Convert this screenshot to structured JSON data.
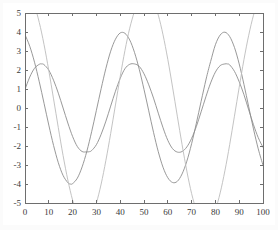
{
  "chart_data": {
    "type": "line",
    "title": "",
    "subtitle": "",
    "xlabel": "",
    "ylabel": "",
    "xlim": [
      0,
      100
    ],
    "ylim": [
      -5,
      5
    ],
    "grid": false,
    "legend": "none",
    "background_color": "#ffffff",
    "frame_color": "#6e6e6e",
    "xticks": [
      0,
      10,
      20,
      30,
      40,
      50,
      60,
      70,
      80,
      90,
      100
    ],
    "xtick_labels": [
      "0",
      "10",
      "20",
      "30",
      "40",
      "50",
      "60",
      "70",
      "80",
      "90",
      "100"
    ],
    "yticks": [
      -5,
      -4,
      -3,
      -2,
      -1,
      0,
      1,
      2,
      3,
      4,
      5
    ],
    "ytick_labels": [
      "-5",
      "-4",
      "-3",
      "-2",
      "-1",
      "0",
      "1",
      "2",
      "3",
      "4",
      "5"
    ],
    "clipped_to_ylim": true,
    "series": [
      {
        "name": "series-1",
        "color": "#8d8d8d",
        "amplitude": 4.0,
        "period": 38.5,
        "phase_deg": 75,
        "offset": 0.0,
        "x": [
          0,
          2,
          4,
          6,
          8,
          10,
          12,
          14,
          16,
          18,
          19,
          20,
          22,
          24,
          26,
          28,
          30,
          32,
          34,
          36,
          38,
          40,
          42,
          44,
          46,
          48,
          50,
          52,
          54,
          56,
          58,
          60,
          62,
          64,
          66,
          68,
          70,
          72,
          74,
          76,
          77,
          78,
          80,
          82,
          84,
          86,
          88,
          90,
          92,
          94,
          96,
          98,
          100
        ],
        "y": [
          3.86,
          3.25,
          2.41,
          1.38,
          0.25,
          -0.9,
          -1.97,
          -2.88,
          -3.55,
          -3.93,
          -4.0,
          -3.98,
          -3.69,
          -3.1,
          -2.27,
          -1.25,
          -0.12,
          1.02,
          2.09,
          2.99,
          3.62,
          3.95,
          3.93,
          3.58,
          2.93,
          2.04,
          0.98,
          -0.15,
          -1.28,
          -2.3,
          -3.12,
          -3.67,
          -3.92,
          -3.86,
          -3.47,
          -2.8,
          -1.88,
          -0.8,
          0.35,
          1.47,
          1.98,
          2.45,
          3.33,
          3.84,
          3.99,
          3.76,
          3.19,
          2.32,
          1.24,
          0.06,
          -1.1,
          -2.15,
          -3.01
        ]
      },
      {
        "name": "series-2",
        "color": "#8d8d8d",
        "amplitude": 2.32,
        "period": 38.5,
        "phase_deg": 25,
        "offset": 0.0,
        "x": [
          0,
          2,
          4,
          6,
          7,
          8,
          10,
          12,
          14,
          16,
          18,
          20,
          22,
          24,
          26,
          27,
          28,
          30,
          32,
          34,
          36,
          38,
          40,
          42,
          44,
          46,
          48,
          50,
          52,
          54,
          56,
          58,
          60,
          62,
          64,
          66,
          68,
          70,
          72,
          74,
          76,
          78,
          80,
          82,
          84,
          85,
          86,
          88,
          90,
          92,
          94,
          96,
          98,
          100
        ],
        "y": [
          0.98,
          1.63,
          2.09,
          2.3,
          2.32,
          2.28,
          1.99,
          1.46,
          0.78,
          0.0,
          -0.79,
          -1.5,
          -2.03,
          -2.29,
          -2.31,
          -2.3,
          -2.24,
          -1.93,
          -1.38,
          -0.69,
          0.1,
          0.88,
          1.56,
          2.07,
          2.3,
          2.32,
          2.19,
          1.8,
          1.22,
          0.52,
          -0.27,
          -1.04,
          -1.7,
          -2.14,
          -2.32,
          -2.29,
          -2.05,
          -1.6,
          -0.97,
          -0.2,
          0.59,
          1.32,
          1.89,
          2.23,
          2.32,
          2.32,
          2.27,
          1.93,
          1.38,
          0.7,
          -0.1,
          -0.88,
          -1.56,
          -2.07
        ]
      },
      {
        "name": "series-3",
        "color": "#bcbcbc",
        "amplitude": 6.1,
        "period": 38.5,
        "phase_deg": 90,
        "offset": 0.0,
        "note": "amplitude exceeds axis range; curve is clipped at y = +5 and y = -5",
        "x": [
          0,
          2,
          4,
          6,
          8,
          10,
          12,
          14,
          16,
          18,
          20,
          22,
          24,
          26,
          28,
          30,
          32,
          34,
          36,
          38,
          40,
          42,
          44,
          46,
          48,
          50,
          52,
          54,
          56,
          58,
          60,
          62,
          64,
          66,
          68,
          70,
          72,
          74,
          76,
          78,
          80,
          82,
          84,
          86,
          88,
          90,
          92,
          94,
          96,
          98,
          100
        ],
        "y": [
          6.1,
          5.92,
          5.38,
          4.5,
          3.34,
          1.97,
          0.48,
          -1.04,
          -2.5,
          -3.79,
          -4.85,
          -5.6,
          -6.0,
          -6.03,
          -5.69,
          -5.0,
          -4.0,
          -2.75,
          -1.34,
          0.16,
          1.65,
          3.03,
          4.2,
          5.08,
          5.7,
          6.05,
          6.01,
          5.62,
          4.89,
          3.85,
          2.56,
          1.1,
          -0.43,
          -1.93,
          -3.32,
          -4.5,
          -5.38,
          -5.92,
          -6.1,
          -5.91,
          -5.36,
          -4.47,
          -3.3,
          -1.93,
          -0.43,
          1.09,
          2.55,
          3.83,
          4.88,
          5.62,
          6.0
        ]
      }
    ]
  }
}
